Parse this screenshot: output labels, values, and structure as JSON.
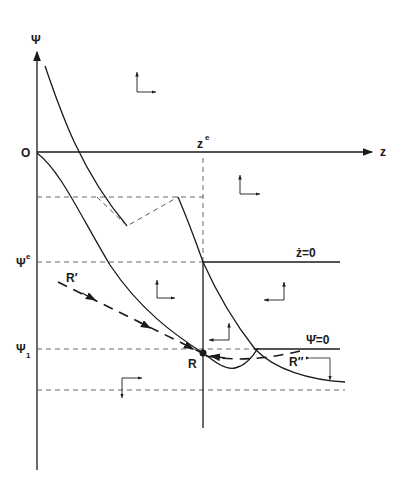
{
  "diagram": {
    "type": "phase-diagram",
    "axes": {
      "vertical": {
        "label": "Ψ",
        "origin_label": "O"
      },
      "horizontal": {
        "label": "z"
      }
    },
    "levels": {
      "z_equilibrium": {
        "base": "z",
        "sup": "e"
      },
      "psi_equilibrium": {
        "base": "Ψ",
        "sup": "e"
      },
      "psi_1": {
        "base": "Ψ",
        "sub": "1"
      }
    },
    "isoclines": {
      "z_dot_zero": "ż=0",
      "psi_dot_zero": "Ψ̇=0"
    },
    "points": {
      "R": "R",
      "R_prime": "R′",
      "R_double_prime": "R″"
    }
  }
}
